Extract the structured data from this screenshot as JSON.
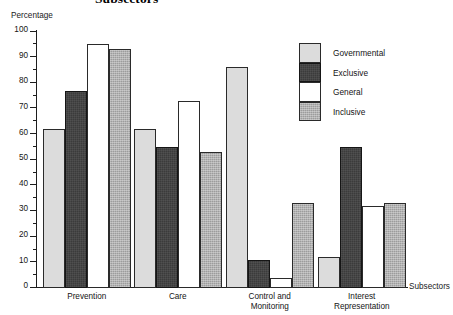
{
  "chart_data": {
    "type": "bar",
    "title": "Subsectors",
    "xlabel": "Subsectors",
    "ylabel": "Percentage",
    "ylim": [
      0,
      100
    ],
    "ytick_step": 10,
    "yticks": [
      0,
      10,
      20,
      30,
      40,
      50,
      60,
      70,
      80,
      90,
      100
    ],
    "ytick_labels": [
      "0",
      "10",
      "20",
      "30",
      "40",
      "50",
      "60",
      "70",
      "80",
      "90",
      "100"
    ],
    "minor_ticks": true,
    "grid": false,
    "legend_position": "top-right",
    "categories": [
      "Prevention",
      "Care",
      "Control and Monitoring",
      "Interest Representation"
    ],
    "series": [
      {
        "name": "Governmental",
        "color": "#dcdcdc",
        "values": [
          62,
          62,
          86,
          12
        ]
      },
      {
        "name": "Exclusive",
        "color": "#3b3b3b",
        "values": [
          77,
          55,
          11,
          55
        ]
      },
      {
        "name": "General",
        "color": "#ffffff",
        "values": [
          95,
          73,
          4,
          32
        ]
      },
      {
        "name": "Inclusive",
        "color": "#9c9c9c",
        "values": [
          93,
          53,
          33,
          33
        ]
      }
    ]
  },
  "axis": {
    "y_title": "Percentage",
    "x_title": "Subsectors"
  },
  "legend": {
    "items": [
      {
        "label": "Governmental"
      },
      {
        "label": "Exclusive"
      },
      {
        "label": "General"
      },
      {
        "label": "Inclusive"
      }
    ]
  },
  "categories_display": [
    {
      "line1": "Prevention",
      "line2": ""
    },
    {
      "line1": "Care",
      "line2": ""
    },
    {
      "line1": "Control and",
      "line2": "Monitoring"
    },
    {
      "line1": "Interest",
      "line2": "Representation"
    }
  ]
}
